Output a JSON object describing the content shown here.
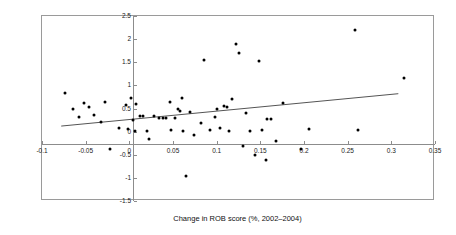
{
  "chart_data": {
    "type": "scatter",
    "title": "",
    "xlabel": "Change in ROB score (%, 2002–2004)",
    "ylabel": "Change in market capital (%, Oct 2002–Aug 2005)",
    "xlim": [
      -0.1,
      0.35
    ],
    "ylim": [
      -1.5,
      2.5
    ],
    "xticks": [
      "-0.1",
      "-0.05",
      "0",
      "0.05",
      "0.1",
      "0.15",
      "0.2",
      "0.25",
      "0.3",
      "0.35"
    ],
    "xtick_values": [
      -0.1,
      -0.05,
      0,
      0.05,
      0.1,
      0.15,
      0.2,
      0.25,
      0.3,
      0.35
    ],
    "yticks": [
      "2.5",
      "2",
      "1.5",
      "1",
      "0.5",
      "0",
      "-0.5",
      "-1",
      "-1.5"
    ],
    "ytick_values": [
      2.5,
      2,
      1.5,
      1,
      0.5,
      0,
      -0.5,
      -1,
      -1.5
    ],
    "grid": false,
    "legend": "none",
    "series": [
      {
        "name": "Companies",
        "marker": "filled-circle",
        "color": "#000000",
        "points": [
          [
            -0.074,
            0.84
          ],
          [
            -0.064,
            0.49
          ],
          [
            -0.058,
            0.31
          ],
          [
            -0.052,
            0.62
          ],
          [
            -0.046,
            0.53
          ],
          [
            -0.04,
            0.36
          ],
          [
            -0.032,
            0.21
          ],
          [
            -0.028,
            0.64
          ],
          [
            -0.022,
            -0.38
          ],
          [
            -0.012,
            0.08
          ],
          [
            -0.004,
            0.57
          ],
          [
            -0.002,
            0.05
          ],
          [
            0.002,
            0.72
          ],
          [
            0.004,
            0.26
          ],
          [
            0.006,
            0.02
          ],
          [
            0.008,
            0.6
          ],
          [
            0.012,
            0.33
          ],
          [
            0.016,
            0.33
          ],
          [
            0.02,
            0.02
          ],
          [
            0.022,
            -0.16
          ],
          [
            0.028,
            0.33
          ],
          [
            0.034,
            0.3
          ],
          [
            0.038,
            0.29
          ],
          [
            0.042,
            0.29
          ],
          [
            0.046,
            0.64
          ],
          [
            0.048,
            0.03
          ],
          [
            0.052,
            0.3
          ],
          [
            0.056,
            0.48
          ],
          [
            0.058,
            0.45
          ],
          [
            0.06,
            0.72
          ],
          [
            0.062,
            0.02
          ],
          [
            0.065,
            -0.95
          ],
          [
            0.07,
            0.42
          ],
          [
            0.074,
            -0.07
          ],
          [
            0.082,
            0.19
          ],
          [
            0.086,
            1.55
          ],
          [
            0.092,
            0.03
          ],
          [
            0.098,
            0.32
          ],
          [
            0.1,
            0.5
          ],
          [
            0.104,
            0.07
          ],
          [
            0.108,
            0.55
          ],
          [
            0.112,
            0.54
          ],
          [
            0.114,
            0.02
          ],
          [
            0.118,
            0.7
          ],
          [
            0.122,
            1.9
          ],
          [
            0.126,
            1.7
          ],
          [
            0.13,
            -0.31
          ],
          [
            0.134,
            0.4
          ],
          [
            0.138,
            0.02
          ],
          [
            0.144,
            -0.5
          ],
          [
            0.148,
            1.52
          ],
          [
            0.152,
            0.03
          ],
          [
            0.156,
            -0.62
          ],
          [
            0.158,
            0.28
          ],
          [
            0.162,
            0.28
          ],
          [
            0.168,
            -0.2
          ],
          [
            0.176,
            0.62
          ],
          [
            0.196,
            -0.37
          ],
          [
            0.206,
            0.06
          ],
          [
            0.258,
            2.2
          ],
          [
            0.262,
            0.03
          ],
          [
            0.315,
            1.15
          ]
        ]
      }
    ],
    "trend_line": {
      "name": "linear fit",
      "color": "#555555",
      "x_start": -0.078,
      "y_start": 0.12,
      "x_end": 0.308,
      "y_end": 0.82
    }
  }
}
